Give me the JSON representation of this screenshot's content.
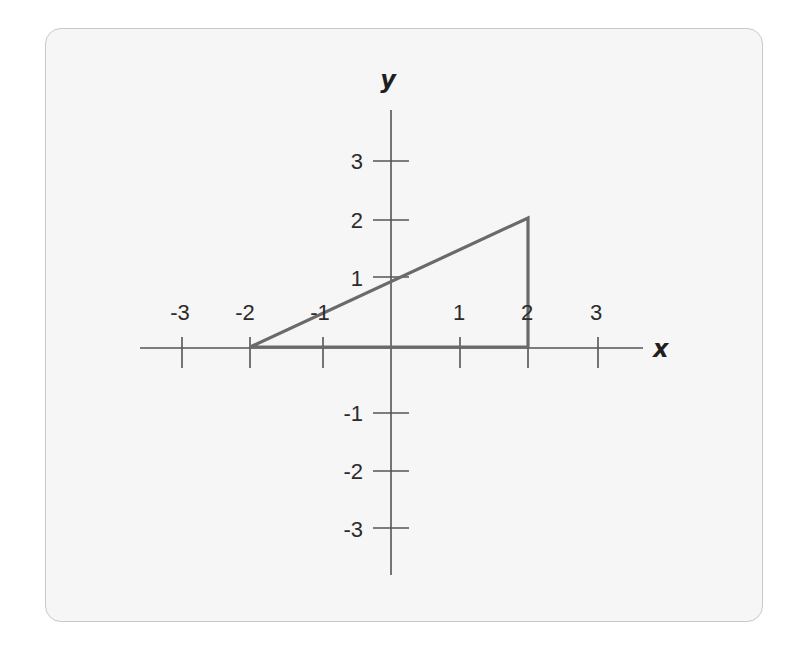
{
  "diagram": {
    "type": "coordinate-plane",
    "axes": {
      "x_label": "x",
      "y_label": "y",
      "x_ticks": [
        "-3",
        "-2",
        "-1",
        "1",
        "2",
        "3"
      ],
      "y_ticks": [
        "3",
        "2",
        "1",
        "-1",
        "-2",
        "-3"
      ]
    },
    "shape": {
      "type": "triangle",
      "vertices": [
        [
          -2,
          0
        ],
        [
          2,
          0
        ],
        [
          2,
          2
        ]
      ]
    },
    "colors": {
      "card_background": "#f6f6f6",
      "card_border": "#c9c9c9",
      "axis": "#555555",
      "shape_stroke": "#6a6a6a"
    }
  }
}
